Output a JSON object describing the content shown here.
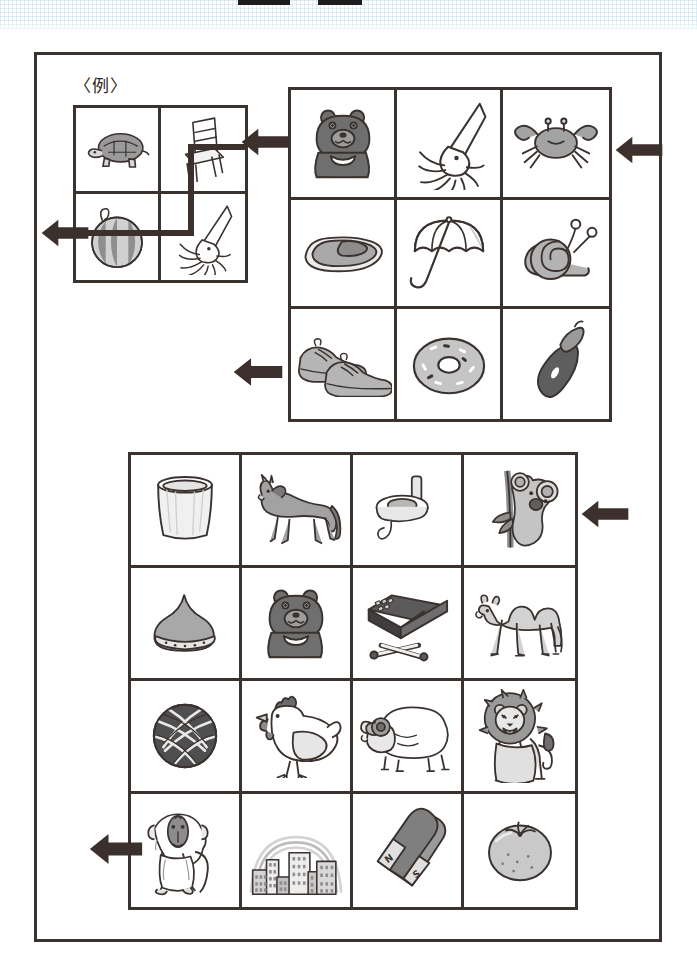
{
  "worksheet": {
    "background_color": "#ffffff",
    "ink_color": "#3a322f",
    "arrow_color": "#3b302b",
    "scan_band_color": "#c4e0eb"
  },
  "example": {
    "label": "〈例〉",
    "rows": 2,
    "cols": 2,
    "cells": [
      {
        "id": "ex-r1c1",
        "icon": "turtle-icon",
        "name": "turtle"
      },
      {
        "id": "ex-r1c2",
        "icon": "chair-icon",
        "name": "chair"
      },
      {
        "id": "ex-r2c1",
        "icon": "watermelon-icon",
        "name": "watermelon"
      },
      {
        "id": "ex-r2c2",
        "icon": "squid-icon",
        "name": "squid"
      }
    ],
    "entry_arrow": {
      "direction": "left",
      "target": "ex-r1c2"
    },
    "exit_arrow": {
      "direction": "left",
      "source": "ex-r2c1"
    },
    "path": "enters-right-into-chair, down-to-squid, left-through-watermelon, exits-left"
  },
  "grid_small": {
    "rows": 3,
    "cols": 3,
    "cells": [
      {
        "id": "s-r1c1",
        "icon": "bear-icon",
        "name": "bear"
      },
      {
        "id": "s-r1c2",
        "icon": "squid-icon",
        "name": "squid"
      },
      {
        "id": "s-r1c3",
        "icon": "crab-icon",
        "name": "crab"
      },
      {
        "id": "s-r2c1",
        "icon": "bread-icon",
        "name": "bread-roll"
      },
      {
        "id": "s-r2c2",
        "icon": "umbrella-icon",
        "name": "umbrella"
      },
      {
        "id": "s-r2c3",
        "icon": "snail-icon",
        "name": "snail"
      },
      {
        "id": "s-r3c1",
        "icon": "shoes-icon",
        "name": "shoes"
      },
      {
        "id": "s-r3c2",
        "icon": "donut-icon",
        "name": "donut"
      },
      {
        "id": "s-r3c3",
        "icon": "acorn-icon",
        "name": "acorn"
      }
    ],
    "entry_arrow": {
      "direction": "left",
      "row": 1,
      "side": "right"
    },
    "exit_arrow": {
      "direction": "left",
      "row": 3,
      "side": "left"
    }
  },
  "grid_large": {
    "rows": 4,
    "cols": 4,
    "cells": [
      {
        "id": "l-r1c1",
        "icon": "bucket-icon",
        "name": "bucket"
      },
      {
        "id": "l-r1c2",
        "icon": "horse-icon",
        "name": "horse"
      },
      {
        "id": "l-r1c3",
        "icon": "spinning-top-icon",
        "name": "spinning-top"
      },
      {
        "id": "l-r1c4",
        "icon": "koala-icon",
        "name": "koala"
      },
      {
        "id": "l-r2c1",
        "icon": "chestnut-icon",
        "name": "chestnut"
      },
      {
        "id": "l-r2c2",
        "icon": "bear-icon",
        "name": "bear"
      },
      {
        "id": "l-r2c3",
        "icon": "matchbox-icon",
        "name": "matchbox"
      },
      {
        "id": "l-r2c4",
        "icon": "camel-icon",
        "name": "camel"
      },
      {
        "id": "l-r3c1",
        "icon": "yarn-ball-icon",
        "name": "yarn-ball"
      },
      {
        "id": "l-r3c2",
        "icon": "chicken-icon",
        "name": "chicken"
      },
      {
        "id": "l-r3c3",
        "icon": "sheep-icon",
        "name": "sheep"
      },
      {
        "id": "l-r3c4",
        "icon": "lion-icon",
        "name": "lion"
      },
      {
        "id": "l-r4c1",
        "icon": "baboon-icon",
        "name": "baboon"
      },
      {
        "id": "l-r4c2",
        "icon": "cityscape-icon",
        "name": "city-with-rainbow"
      },
      {
        "id": "l-r4c3",
        "icon": "magnet-icon",
        "name": "magnet"
      },
      {
        "id": "l-r4c4",
        "icon": "persimmon-icon",
        "name": "persimmon"
      }
    ],
    "magnet_labels": {
      "north": "N",
      "south": "S"
    },
    "entry_arrow": {
      "direction": "left",
      "row": 1,
      "side": "right"
    },
    "exit_arrow": {
      "direction": "left",
      "row": 4,
      "side": "left"
    }
  }
}
